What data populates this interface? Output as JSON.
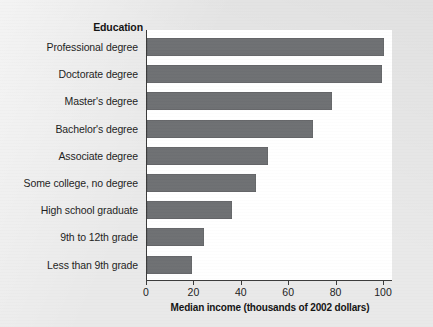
{
  "chart_data": {
    "type": "bar",
    "orientation": "horizontal",
    "title": "",
    "category_header": "Education",
    "categories": [
      "Professional degree",
      "Doctorate degree",
      "Master's degree",
      "Bachelor's degree",
      "Associate degree",
      "Some college, no degree",
      "High school graduate",
      "9th to 12th grade",
      "Less than 9th grade"
    ],
    "values": [
      100,
      99,
      78,
      70,
      51,
      46,
      36,
      24,
      19
    ],
    "xlabel": "Median income (thousands of 2002 dollars)",
    "ylabel": "Education",
    "xlim": [
      0,
      100
    ],
    "xticks": [
      0,
      20,
      40,
      60,
      80,
      100
    ],
    "xtick_labels": [
      "0",
      "20",
      "40",
      "60",
      "80",
      "100"
    ],
    "grid": false,
    "legend": false,
    "bar_color": "#6e7073",
    "axis_color": "#3a3a3a",
    "plot_background": "#ffffff",
    "page_background": "#e9e9e9"
  }
}
